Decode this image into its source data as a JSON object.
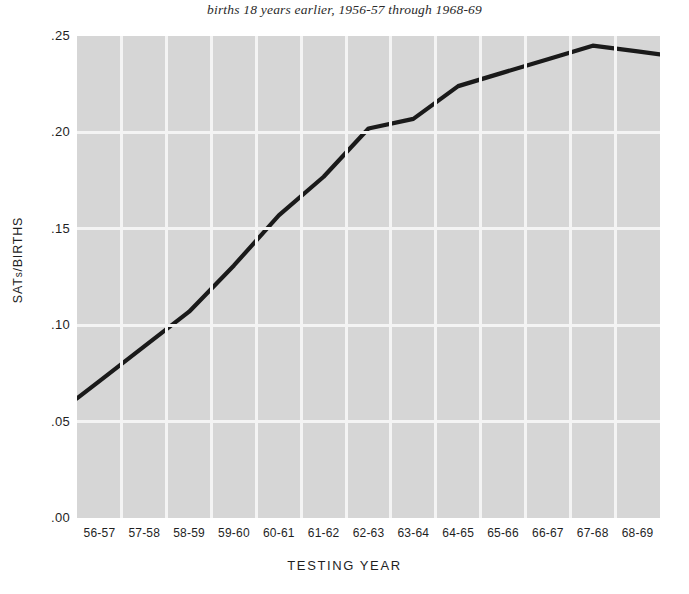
{
  "chart_data": {
    "type": "line",
    "title": "births 18 years earlier, 1956-57 through 1968-69",
    "xlabel": "TESTING YEAR",
    "ylabel": "SATs/BIRTHS",
    "ylabel_main": "SAT",
    "ylabel_sub": "s",
    "ylabel_tail": "/BIRTHS",
    "categories": [
      "56-57",
      "57-58",
      "58-59",
      "59-60",
      "60-61",
      "61-62",
      "62-63",
      "63-64",
      "64-65",
      "65-66",
      "66-67",
      "67-68",
      "68-69"
    ],
    "values": [
      0.071,
      0.089,
      0.107,
      0.131,
      0.157,
      0.177,
      0.202,
      0.207,
      0.224,
      0.231,
      0.238,
      0.245,
      0.242
    ],
    "ylim": [
      0.0,
      0.25
    ],
    "ytick_values": [
      0.25,
      0.2,
      0.15,
      0.1,
      0.05,
      0.0
    ],
    "ytick_labels": [
      ".25",
      ".20",
      ".15",
      ".10",
      ".05",
      ".00"
    ],
    "grid": true,
    "legend": "none",
    "colors": {
      "plot_background": "#d6d6d6",
      "gridline": "#f4f4f4",
      "series_line": "#1a1a1a",
      "page_background": "#ffffff",
      "text": "#1f1f1f"
    }
  }
}
